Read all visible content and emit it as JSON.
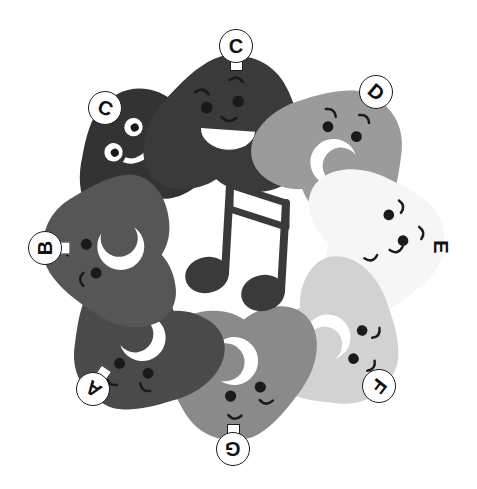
{
  "figure": {
    "background_color": "#ffffff",
    "width": 477,
    "height": 489
  },
  "center_icon": {
    "name": "beamed-eighth-notes-icon",
    "label": "beamed eighth notes",
    "color": "#3a3a3a",
    "x": 233,
    "y": 245
  },
  "blobs": [
    {
      "id": "blob-c-prime",
      "label": "Ɔ",
      "label_plain": "C",
      "color": "#333333",
      "cx": 143,
      "cy": 145,
      "rotation": -28,
      "scale": 0.92,
      "eye_style": "white-ring",
      "mouth_style": "white-smile",
      "badge": {
        "x": 88,
        "y": 91,
        "rotation": 200,
        "ring": true,
        "tab": false
      }
    },
    {
      "id": "blob-c",
      "label": "C",
      "label_plain": "C",
      "color": "#3a3a3a",
      "cx": 235,
      "cy": 120,
      "rotation": 4,
      "scale": 1.04,
      "eye_style": "dark-dot",
      "mouth_style": "white-grin",
      "badge": {
        "x": 219,
        "y": 29,
        "rotation": 0,
        "ring": true,
        "tab": true
      }
    },
    {
      "id": "blob-d",
      "label": "D",
      "label_plain": "D",
      "color": "#9b9b9b",
      "cx": 345,
      "cy": 150,
      "rotation": 34,
      "scale": 0.97,
      "eye_style": "dark-dot",
      "mouth_style": "white-crescent",
      "badge": {
        "x": 359,
        "y": 75,
        "rotation": 40,
        "ring": true,
        "tab": false
      }
    },
    {
      "id": "blob-e",
      "label": "E",
      "label_plain": "E",
      "color": "#f6f6f6",
      "cx": 386,
      "cy": 243,
      "rotation": 76,
      "scale": 0.95,
      "eye_style": "dark-dot",
      "mouth_style": "plain",
      "badge": {
        "x": 424,
        "y": 230,
        "rotation": 90,
        "ring": false,
        "tab": false
      }
    },
    {
      "id": "blob-f",
      "label": "F",
      "label_plain": "F",
      "color": "#d2d2d2",
      "cx": 340,
      "cy": 348,
      "rotation": 122,
      "scale": 0.95,
      "eye_style": "dark-dot",
      "mouth_style": "white-crescent",
      "badge": {
        "x": 362,
        "y": 369,
        "rotation": 128,
        "ring": true,
        "tab": false
      }
    },
    {
      "id": "blob-g",
      "label": "G",
      "label_plain": "G",
      "color": "#8a8a8a",
      "cx": 232,
      "cy": 378,
      "rotation": 178,
      "scale": 1.0,
      "eye_style": "dark-dot",
      "mouth_style": "white-crescent",
      "badge": {
        "x": 216,
        "y": 432,
        "rotation": 180,
        "ring": true,
        "tab": true
      }
    },
    {
      "id": "blob-a",
      "label": "A",
      "label_plain": "A",
      "color": "#4a4a4a",
      "cx": 131,
      "cy": 350,
      "rotation": 214,
      "scale": 0.97,
      "eye_style": "dark-dot",
      "mouth_style": "white-crescent",
      "badge": {
        "x": 76,
        "y": 372,
        "rotation": 215,
        "ring": true,
        "tab": true
      }
    },
    {
      "id": "blob-b",
      "label": "B",
      "label_plain": "B",
      "color": "#565656",
      "cx": 104,
      "cy": 245,
      "rotation": 266,
      "scale": 0.98,
      "eye_style": "dark-dot",
      "mouth_style": "white-crescent",
      "badge": {
        "x": 28,
        "y": 231,
        "rotation": 270,
        "ring": true,
        "tab": true
      }
    }
  ],
  "colors": {
    "ink": "#1c1c1c",
    "background": "#ffffff",
    "note": "#3a3a3a",
    "face_feature_dark": "#1a1a1a",
    "face_feature_light": "#ffffff"
  }
}
